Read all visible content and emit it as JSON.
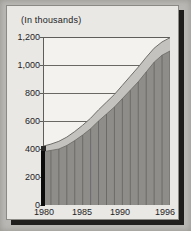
{
  "figure": {
    "caption": "(In thousands)",
    "background_color": "#b9b8b4",
    "card_color": "#e9e8e4",
    "plot_background": "#f3f2ef"
  },
  "chart_data": {
    "type": "area",
    "title": "(In thousands)",
    "subtitle": "",
    "xlabel": "",
    "ylabel": "In thousands",
    "stacked": true,
    "grid": true,
    "legend_position": "none",
    "xlim": [
      1980,
      1996
    ],
    "ylim": [
      0,
      1200
    ],
    "yticks": [
      0,
      200,
      400,
      600,
      800,
      1000,
      1200
    ],
    "ytick_labels": [
      "0",
      "200",
      "400",
      "600",
      "800",
      "1,000",
      "1,200"
    ],
    "xticks": [
      1980,
      1985,
      1990,
      1996
    ],
    "xtick_labels": [
      "1980",
      "1985",
      "1990",
      "1996"
    ],
    "x": [
      1980,
      1981,
      1982,
      1983,
      1984,
      1985,
      1986,
      1987,
      1988,
      1989,
      1990,
      1991,
      1992,
      1993,
      1994,
      1995,
      1996
    ],
    "series": [
      {
        "name": "lower-band",
        "color": "#8e8d89",
        "values": [
          380,
          390,
          400,
          425,
          460,
          500,
          545,
          600,
          650,
          700,
          760,
          820,
          880,
          950,
          1020,
          1070,
          1100
        ]
      },
      {
        "name": "upper-band",
        "color": "#c3c2be",
        "values": [
          40,
          45,
          55,
          60,
          65,
          70,
          75,
          80,
          85,
          90,
          95,
          100,
          105,
          105,
          100,
          95,
          95
        ]
      }
    ],
    "totals": [
      420,
      435,
      455,
      485,
      525,
      570,
      620,
      680,
      735,
      790,
      855,
      920,
      985,
      1055,
      1120,
      1165,
      1195
    ],
    "annotations": []
  },
  "axis_labels": {
    "y": [
      "1,200",
      "1,000",
      "800",
      "600",
      "400",
      "200",
      "0"
    ],
    "x": [
      "1980",
      "1985",
      "1990",
      "1996"
    ]
  }
}
